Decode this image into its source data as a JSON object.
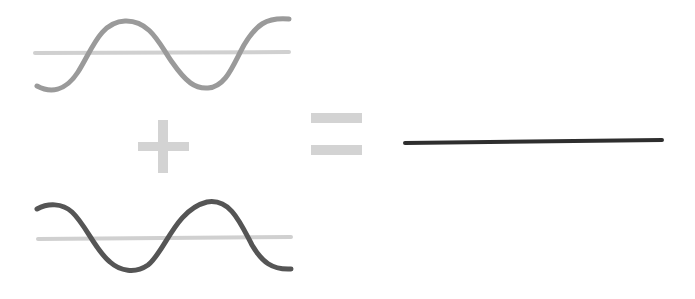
{
  "diagram": {
    "title": "",
    "colors": {
      "background": "#ffffff",
      "wave_top": "#9a9a9a",
      "wave_bottom": "#555555",
      "axis": "#d0d0d0",
      "operator": "#d3d3d3",
      "result": "#2e2e2e"
    },
    "elements": [
      {
        "id": "wave-top",
        "type": "sine-wave",
        "phase": "original"
      },
      {
        "id": "plus",
        "type": "operator",
        "symbol": "+"
      },
      {
        "id": "wave-bottom",
        "type": "sine-wave",
        "phase": "inverted"
      },
      {
        "id": "equals",
        "type": "operator",
        "symbol": "="
      },
      {
        "id": "result",
        "type": "flat-line",
        "meaning": "cancellation"
      }
    ]
  }
}
